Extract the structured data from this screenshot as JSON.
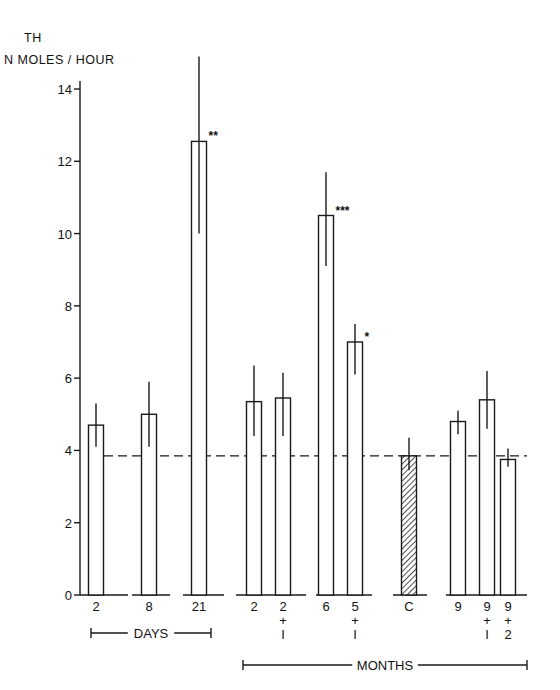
{
  "chart_data": {
    "type": "bar",
    "title": "",
    "ylabel_line1": "TH",
    "ylabel_line2": "N MOLES / HOUR",
    "xlabel": "",
    "ylim": [
      0,
      14
    ],
    "yticks": [
      0,
      2,
      4,
      6,
      8,
      10,
      12,
      14
    ],
    "grid": false,
    "control_reference_line": 3.85,
    "categories": [
      "2",
      "8",
      "21",
      "2",
      "2+1",
      "6",
      "5+1",
      "C",
      "9",
      "9+1",
      "9+2"
    ],
    "bars": [
      {
        "label": [
          "2"
        ],
        "value": 4.7,
        "err_low": 4.1,
        "err_high": 5.3,
        "sig": "",
        "hatched": false,
        "group": "days"
      },
      {
        "label": [
          "8"
        ],
        "value": 5.0,
        "err_low": 4.1,
        "err_high": 5.9,
        "sig": "",
        "hatched": false,
        "group": "days"
      },
      {
        "label": [
          "21"
        ],
        "value": 12.55,
        "err_low": 10.0,
        "err_high": 14.9,
        "sig": "**",
        "hatched": false,
        "group": "days"
      },
      {
        "label": [
          "2"
        ],
        "value": 5.35,
        "err_low": 4.4,
        "err_high": 6.35,
        "sig": "",
        "hatched": false,
        "group": "months"
      },
      {
        "label": [
          "2",
          "+",
          "I"
        ],
        "value": 5.45,
        "err_low": 4.4,
        "err_high": 6.15,
        "sig": "",
        "hatched": false,
        "group": "months"
      },
      {
        "label": [
          "6"
        ],
        "value": 10.5,
        "err_low": 9.1,
        "err_high": 11.7,
        "sig": "***",
        "hatched": false,
        "group": "months"
      },
      {
        "label": [
          "5",
          "+",
          "I"
        ],
        "value": 7.0,
        "err_low": 6.1,
        "err_high": 7.5,
        "sig": "*",
        "hatched": false,
        "group": "months"
      },
      {
        "label": [
          "C"
        ],
        "value": 3.85,
        "err_low": 3.45,
        "err_high": 4.35,
        "sig": "",
        "hatched": true,
        "group": "control"
      },
      {
        "label": [
          "9"
        ],
        "value": 4.8,
        "err_low": 4.45,
        "err_high": 5.1,
        "sig": "",
        "hatched": false,
        "group": "months"
      },
      {
        "label": [
          "9",
          "+",
          "I"
        ],
        "value": 5.4,
        "err_low": 4.6,
        "err_high": 6.2,
        "sig": "",
        "hatched": false,
        "group": "months"
      },
      {
        "label": [
          "9",
          "+",
          "2"
        ],
        "value": 3.75,
        "err_low": 3.55,
        "err_high": 4.05,
        "sig": "",
        "hatched": false,
        "group": "months"
      }
    ],
    "group_brackets": [
      {
        "label": "DAYS",
        "from_bar": 0,
        "to_bar": 2
      },
      {
        "label": "MONTHS",
        "from_bar": 3,
        "to_bar": 10
      }
    ]
  }
}
